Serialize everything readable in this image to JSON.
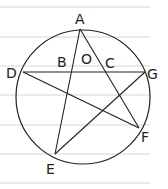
{
  "diagram": {
    "type": "circle with inscribed pentagram-like chords",
    "points": {
      "A": {
        "label": "A",
        "x": 80,
        "y": 29
      },
      "B": {
        "label": "B",
        "x": 62,
        "y": 66
      },
      "O": {
        "label": "O",
        "x": 86,
        "y": 62
      },
      "C": {
        "label": "C",
        "x": 108,
        "y": 66
      },
      "D": {
        "label": "D",
        "x": 14,
        "y": 77
      },
      "G": {
        "label": "G",
        "x": 148,
        "y": 78
      },
      "F": {
        "label": "F",
        "x": 142,
        "y": 140
      },
      "E": {
        "label": "E",
        "x": 48,
        "y": 176
      }
    },
    "segments": [
      "AE",
      "AF",
      "DG",
      "DF",
      "EG"
    ],
    "colors": {
      "stroke": "#222222",
      "ruled_lines": "#d0d0d0"
    }
  }
}
